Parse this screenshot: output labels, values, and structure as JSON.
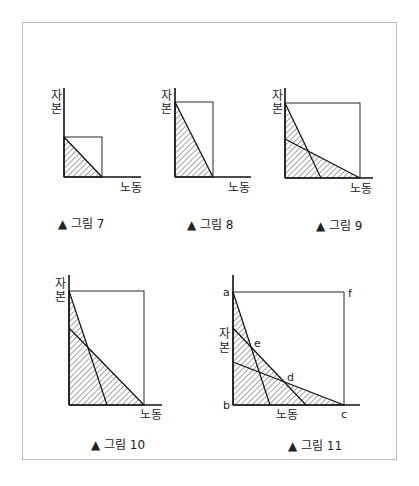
{
  "axis_labels": {
    "y": "자본",
    "x": "노동",
    "y_top": "자",
    "y_bottom": "본"
  },
  "figures": [
    {
      "id": "fig7",
      "caption": "▲ 그림 7"
    },
    {
      "id": "fig8",
      "caption": "▲ 그림 8"
    },
    {
      "id": "fig9",
      "caption": "▲ 그림 9"
    },
    {
      "id": "fig10",
      "caption": "▲ 그림 10"
    },
    {
      "id": "fig11",
      "caption": "▲ 그림 11",
      "points": {
        "a": "a",
        "b": "b",
        "c": "c",
        "d": "d",
        "e": "e",
        "f": "f"
      }
    }
  ],
  "colors": {
    "line": "#111111",
    "frame": "#bdbdbd",
    "hatch": "#333333"
  }
}
